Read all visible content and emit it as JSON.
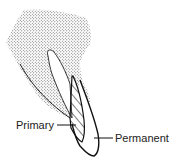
{
  "diagram": {
    "labels": {
      "primary": "Primary",
      "permanent": "Permanent"
    },
    "colors": {
      "stroke": "#111111",
      "stipple": "#555555",
      "background": "#ffffff"
    }
  }
}
